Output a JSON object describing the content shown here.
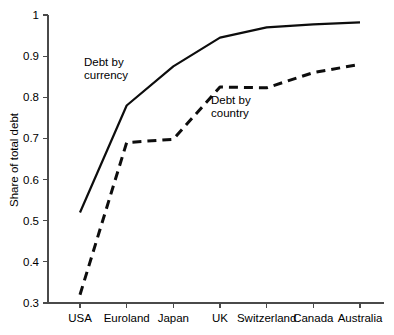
{
  "chart_data": {
    "type": "line",
    "title": "",
    "xlabel": "",
    "ylabel": "Share of total debt",
    "categories": [
      "USA",
      "Euroland",
      "Japan",
      "UK",
      "Switzerland",
      "Canada",
      "Australia"
    ],
    "ylim": [
      0.3,
      1
    ],
    "yticks": [
      0.3,
      0.4,
      0.5,
      0.6,
      0.7,
      0.8,
      0.9,
      1
    ],
    "ytick_labels": [
      "0.3",
      "0.4",
      "0.5",
      "0.6",
      "0.7",
      "0.8",
      "0.9",
      "1"
    ],
    "grid": false,
    "legend_position": "inline-annotations",
    "series": [
      {
        "name": "Debt by currency",
        "style": "solid",
        "color": "#0d0d0d",
        "values": [
          0.52,
          0.78,
          0.875,
          0.945,
          0.97,
          0.977,
          0.982
        ]
      },
      {
        "name": "Debt by country",
        "style": "dashed",
        "color": "#0d0d0d",
        "values": [
          0.32,
          0.69,
          0.698,
          0.825,
          0.823,
          0.86,
          0.88
        ]
      }
    ],
    "annotations": [
      {
        "text_line1": "Debt by",
        "text_line2": "currency",
        "x_px": 84,
        "y_px": 66
      },
      {
        "text_line1": "Debt by",
        "text_line2": "country",
        "x_px": 211,
        "y_px": 104
      }
    ]
  },
  "axis": {
    "y_label": "Share of total debt"
  }
}
